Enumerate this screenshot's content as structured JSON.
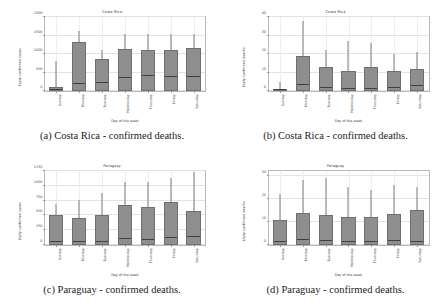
{
  "figure": {
    "xlabel": "Day of the week",
    "days": [
      "Sunday",
      "Monday",
      "Tuesday",
      "Wednesday",
      "Thursday",
      "Friday",
      "Saturday"
    ],
    "box_color": "#8e8e8e",
    "median_color": "#3f3f3f",
    "axis_color": "#b9b9b9"
  },
  "subfigures": [
    {
      "caption": "(a) Costa Rica - confirmed deaths.",
      "title": "Costa Rica",
      "ylabel": "Daily confirmed cases"
    },
    {
      "caption": "(b) Costa Rica - confirmed deaths.",
      "title": "Costa Rica",
      "ylabel": "Daily confirmed deaths"
    },
    {
      "caption": "(c) Paraguay - confirmed deaths.",
      "title": "Paraguay",
      "ylabel": "Daily confirmed cases"
    },
    {
      "caption": "(d) Paraguay - confirmed deaths.",
      "title": "Paraguay",
      "ylabel": "Daily confirmed deaths"
    }
  ],
  "chart_data": [
    {
      "type": "bar",
      "panel": "a",
      "title": "Costa Rica",
      "xlabel": "Day of the week",
      "ylabel": "Daily confirmed cases",
      "categories": [
        "Sunday",
        "Monday",
        "Tuesday",
        "Wednesday",
        "Thursday",
        "Friday",
        "Saturday"
      ],
      "yticks": [
        0,
        500,
        1000,
        1500,
        2000
      ],
      "ylim": [
        0,
        2000
      ],
      "grid": true,
      "legend": "none",
      "box_top": [
        100,
        1320,
        870,
        1140,
        1100,
        1120,
        1160
      ],
      "box_bottom": [
        0,
        0,
        0,
        0,
        0,
        0,
        0
      ],
      "median": [
        40,
        190,
        210,
        360,
        400,
        370,
        390
      ],
      "whisker_top": [
        820,
        1630,
        1120,
        1530,
        1530,
        1550,
        1550
      ],
      "values": [
        100,
        1320,
        870,
        1140,
        1100,
        1120,
        1160
      ]
    },
    {
      "type": "bar",
      "panel": "b",
      "title": "Costa Rica",
      "xlabel": "Day of the week",
      "ylabel": "Daily confirmed deaths",
      "categories": [
        "Sunday",
        "Monday",
        "Tuesday",
        "Wednesday",
        "Thursday",
        "Friday",
        "Saturday"
      ],
      "yticks": [
        0,
        10,
        20,
        30,
        40
      ],
      "ylim": [
        0,
        40
      ],
      "grid": true,
      "legend": "none",
      "box_top": [
        0.6,
        19,
        13,
        11,
        13,
        11,
        12
      ],
      "box_bottom": [
        0,
        0,
        0,
        0,
        0,
        0,
        0
      ],
      "median": [
        0.3,
        3,
        1.5,
        1,
        1,
        1.2,
        2.5
      ],
      "whisker_top": [
        5,
        38,
        22,
        27,
        26,
        20,
        21
      ],
      "values": [
        0.6,
        19,
        13,
        11,
        13,
        11,
        12
      ]
    },
    {
      "type": "bar",
      "panel": "c",
      "title": "Paraguay",
      "xlabel": "Day of the week",
      "ylabel": "Daily confirmed cases",
      "categories": [
        "Sunday",
        "Monday",
        "Tuesday",
        "Wednesday",
        "Thursday",
        "Friday",
        "Saturday"
      ],
      "yticks": [
        0,
        250,
        500,
        750,
        1000,
        1250
      ],
      "ylim": [
        0,
        1250
      ],
      "grid": true,
      "legend": "none",
      "box_top": [
        500,
        450,
        510,
        670,
        650,
        730,
        580
      ],
      "box_bottom": [
        0,
        0,
        0,
        0,
        0,
        0,
        0
      ],
      "median": [
        50,
        45,
        50,
        90,
        70,
        120,
        140
      ],
      "whisker_top": [
        700,
        760,
        880,
        1060,
        1070,
        1130,
        1230
      ],
      "values": [
        500,
        450,
        510,
        670,
        650,
        730,
        580
      ]
    },
    {
      "type": "bar",
      "panel": "d",
      "title": "Paraguay",
      "xlabel": "Day of the week",
      "ylabel": "Daily confirmed deaths",
      "categories": [
        "Sunday",
        "Monday",
        "Tuesday",
        "Wednesday",
        "Thursday",
        "Friday",
        "Saturday"
      ],
      "yticks": [
        0,
        10,
        20,
        30
      ],
      "ylim": [
        0,
        32
      ],
      "grid": true,
      "legend": "none",
      "box_top": [
        11,
        14,
        13,
        12,
        12,
        13.5,
        15
      ],
      "box_bottom": [
        0,
        0,
        0,
        0,
        0,
        0,
        0
      ],
      "median": [
        1,
        2,
        1.5,
        1,
        1,
        1.5,
        1
      ],
      "whisker_top": [
        22,
        28,
        29,
        25,
        24,
        26,
        25
      ],
      "values": [
        11,
        14,
        13,
        12,
        12,
        13.5,
        15
      ]
    }
  ]
}
